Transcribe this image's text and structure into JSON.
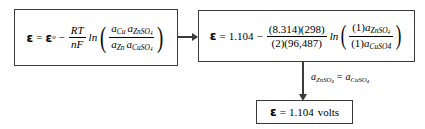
{
  "diagram": {
    "line_color": "#3a3a3a",
    "background": "#ffffff",
    "nodes": {
      "general": {
        "name": "general-nernst-equation",
        "lhs_symbol": "ε",
        "equals": "=",
        "standard_potential": "ε",
        "standard_superscript": "o",
        "minus": "−",
        "coefficient_numerator": "RT",
        "coefficient_denominator": "nF",
        "log_label": "ln",
        "ratio_numerator_left": "a",
        "ratio_numerator_left_sub": "Cu",
        "ratio_numerator_right": "a",
        "ratio_numerator_right_sub": "ZnSO",
        "ratio_numerator_right_sub_num": "4",
        "ratio_denominator_left": "a",
        "ratio_denominator_left_sub": "Zn",
        "ratio_denominator_right": "a",
        "ratio_denominator_right_sub": "CuSO",
        "ratio_denominator_right_sub_num": "4"
      },
      "numeric": {
        "name": "numeric-nernst-equation",
        "lhs_symbol": "ε",
        "equals": "=",
        "cell_potential": "1.104",
        "minus": "−",
        "coefficient_numerator": "(8.314)(298)",
        "coefficient_denominator": "(2)(96,487)",
        "log_label": "ln",
        "ratio_numerator_coeff": "(1)",
        "ratio_numerator_act": "a",
        "ratio_numerator_sub": "ZnSO",
        "ratio_numerator_sub_num": "4",
        "ratio_denominator_coeff": "(1)",
        "ratio_denominator_act": "a",
        "ratio_denominator_sub": "CuSO4"
      },
      "result": {
        "name": "result-cell-potential",
        "lhs_symbol": "ε",
        "equals": "=",
        "value": "1.104",
        "units": "volts"
      }
    },
    "edges": {
      "general_to_numeric": {
        "name": "arrow-general-to-numeric",
        "label": ""
      },
      "numeric_to_result": {
        "name": "arrow-numeric-to-result",
        "label_left_act": "a",
        "label_left_sub": "ZnSO",
        "label_left_sub_num": "4",
        "label_equals": "=",
        "label_right_act": "a",
        "label_right_sub": "CuSO",
        "label_right_sub_num": "4"
      }
    }
  }
}
